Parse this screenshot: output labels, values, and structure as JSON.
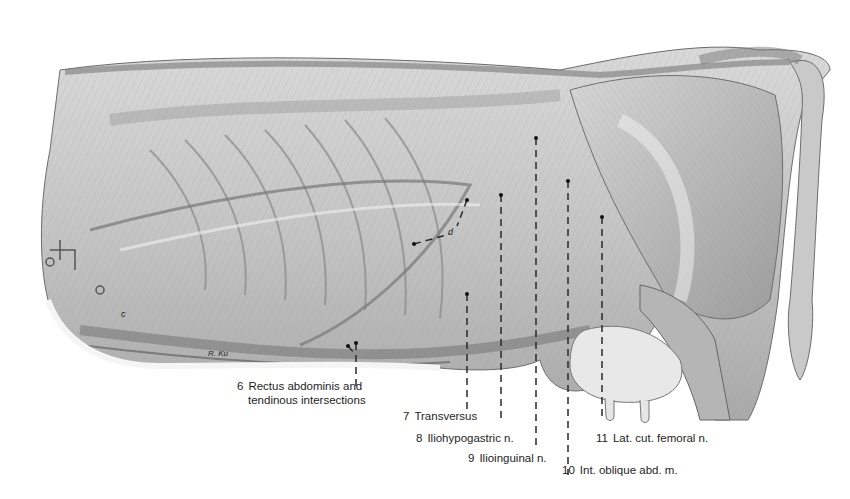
{
  "figure": {
    "colors": {
      "background": "#ffffff",
      "ink": "#1e1e1e",
      "muscle_light": "#e2e2e2",
      "muscle_mid": "#bdbdbd",
      "muscle_dark": "#8a8a8a",
      "leader_line": "#2a2a2a"
    },
    "letters": [
      {
        "id": "d",
        "text": "d"
      },
      {
        "id": "c",
        "text": "c"
      }
    ],
    "signature": "R. Ku",
    "labels": [
      {
        "num": "6",
        "line1": "Rectus abdominis and",
        "line2": "tendinous intersections"
      },
      {
        "num": "7",
        "line1": "Transversus"
      },
      {
        "num": "8",
        "line1": "Iliohypogastric n."
      },
      {
        "num": "9",
        "line1": "Ilioinguinal n."
      },
      {
        "num": "10",
        "line1": "Int. oblique abd. m."
      },
      {
        "num": "11",
        "line1": "Lat. cut. femoral n."
      }
    ]
  }
}
